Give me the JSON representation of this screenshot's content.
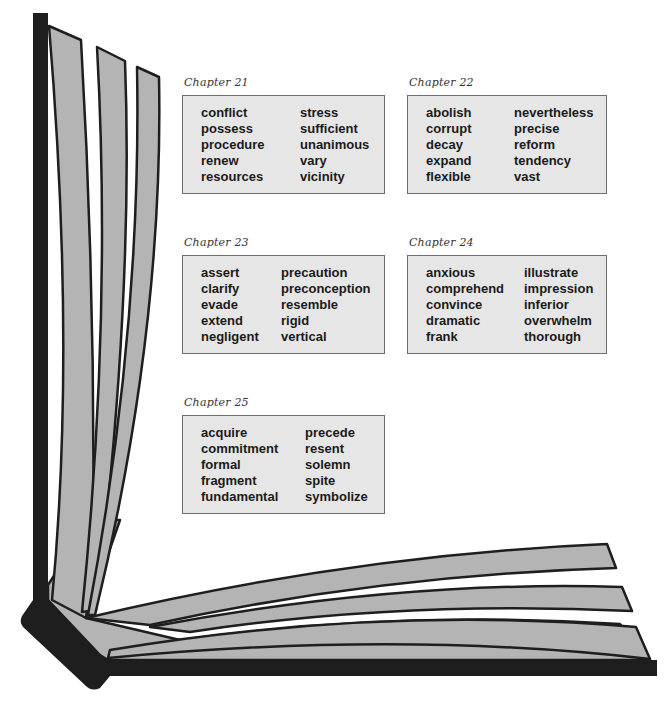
{
  "chapters": [
    {
      "title": "Chapter 21",
      "col1": [
        "conflict",
        "possess",
        "procedure",
        "renew",
        "resources"
      ],
      "col2": [
        "stress",
        "sufficient",
        "unanimous",
        "vary",
        "vicinity"
      ]
    },
    {
      "title": "Chapter 22",
      "col1": [
        "abolish",
        "corrupt",
        "decay",
        "expand",
        "flexible"
      ],
      "col2": [
        "nevertheless",
        "precise",
        "reform",
        "tendency",
        "vast"
      ]
    },
    {
      "title": "Chapter 23",
      "col1": [
        "assert",
        "clarify",
        "evade",
        "extend",
        "negligent"
      ],
      "col2": [
        "precaution",
        "preconception",
        "resemble",
        "rigid",
        "vertical"
      ]
    },
    {
      "title": "Chapter 24",
      "col1": [
        "anxious",
        "comprehend",
        "convince",
        "dramatic",
        "frank"
      ],
      "col2": [
        "illustrate",
        "impression",
        "inferior",
        "overwhelm",
        "thorough"
      ]
    },
    {
      "title": "Chapter 25",
      "col1": [
        "acquire",
        "commitment",
        "formal",
        "fragment",
        "fundamental"
      ],
      "col2": [
        "precede",
        "resent",
        "solemn",
        "spite",
        "symbolize"
      ]
    }
  ],
  "colors": {
    "page_fill": "#b4b4b4",
    "outline": "#1e1e1e",
    "box_fill": "#e6e6e6",
    "box_border": "#6e6e6e"
  }
}
